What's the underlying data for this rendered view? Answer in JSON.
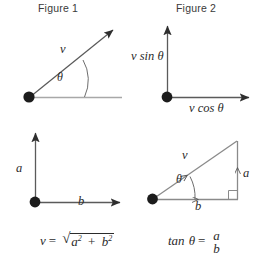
{
  "figures": [
    {
      "title": "Figure 1",
      "labels": {
        "vector": "v",
        "angle": "θ"
      }
    },
    {
      "title": "Figure 2",
      "labels": {
        "vertical": "v sin θ",
        "horizontal": "v cos θ"
      }
    },
    {
      "labels": {
        "vertical": "a",
        "horizontal": "b"
      }
    },
    {
      "labels": {
        "vector": "v",
        "angle": "θ",
        "vertical": "a",
        "horizontal": "b"
      }
    }
  ],
  "formulas": {
    "left": {
      "lhs": "v",
      "equals": "=",
      "radical_sign": "√",
      "term1_base": "a",
      "term1_exp": "2",
      "plus": "+",
      "term2_base": "b",
      "term2_exp": "2"
    },
    "right": {
      "func": "tan",
      "arg": "θ",
      "equals": "=",
      "numerator": "a",
      "denominator": "b"
    }
  },
  "colors": {
    "line": "#8a8a8a",
    "dot": "#1c1c1c",
    "text": "#2b2b2b",
    "background": "#ffffff"
  }
}
